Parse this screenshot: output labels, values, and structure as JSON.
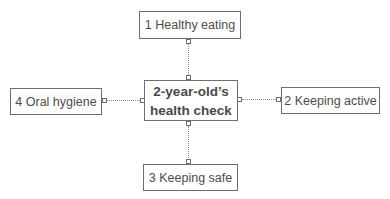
{
  "diagram": {
    "center": {
      "line1": "2-year-old’s",
      "line2": "health check"
    },
    "nodes": [
      {
        "label": "1 Healthy eating",
        "position": "top"
      },
      {
        "label": "2 Keeping active",
        "position": "right"
      },
      {
        "label": "3 Keeping safe",
        "position": "bottom"
      },
      {
        "label": "4 Oral hygiene",
        "position": "left"
      }
    ],
    "colors": {
      "border": "#6e6e6e",
      "text": "#4d4d4d",
      "connector": "#8a8a8a"
    }
  }
}
